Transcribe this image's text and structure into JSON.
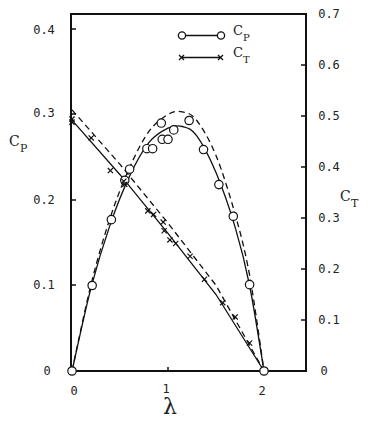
{
  "chart_data": {
    "type": "line",
    "title": "",
    "xlabel": "λ",
    "ylabel_left": "C_P",
    "ylabel_right": "C_T",
    "xlim": [
      0,
      2.45
    ],
    "ylim_left": [
      0,
      0.42
    ],
    "ylim_right": [
      0,
      0.7
    ],
    "grid": false,
    "legend_position": "upper center (inside plot)",
    "x_ticks": [
      0,
      1,
      2
    ],
    "x_tick_labels": [
      "0",
      "1",
      "2"
    ],
    "y_left_ticks": [
      0,
      0.1,
      0.2,
      0.3,
      0.4
    ],
    "y_left_tick_labels": [
      "0",
      "0.1",
      "0.2",
      "0.3",
      "0.4"
    ],
    "y_right_ticks": [
      0,
      0.1,
      0.2,
      0.3,
      0.4,
      0.5,
      0.6,
      0.7
    ],
    "y_right_tick_labels": [
      "0",
      "0.1",
      "0.2",
      "0.3",
      "0.4",
      "0.5",
      "0.6",
      "0.7"
    ],
    "legend": [
      {
        "label": "C_P",
        "marker": "circle",
        "line": "solid"
      },
      {
        "label": "C_T",
        "marker": "x",
        "line": "solid"
      }
    ],
    "series": [
      {
        "name": "C_P measured",
        "axis": "left",
        "marker": "circle",
        "points": [
          [
            0,
            0
          ],
          [
            0.21,
            0.1
          ],
          [
            0.41,
            0.177
          ],
          [
            0.55,
            0.223
          ],
          [
            0.6,
            0.236
          ],
          [
            0.78,
            0.26
          ],
          [
            0.84,
            0.26
          ],
          [
            0.93,
            0.29
          ],
          [
            0.94,
            0.271
          ],
          [
            1.0,
            0.271
          ],
          [
            1.06,
            0.282
          ],
          [
            1.22,
            0.293
          ],
          [
            1.37,
            0.259
          ],
          [
            1.53,
            0.218
          ],
          [
            1.68,
            0.181
          ],
          [
            1.85,
            0.101
          ],
          [
            2.0,
            0
          ]
        ]
      },
      {
        "name": "C_P solid curve",
        "axis": "left",
        "line": "solid",
        "points": [
          [
            0,
            0
          ],
          [
            0.2,
            0.098
          ],
          [
            0.4,
            0.172
          ],
          [
            0.6,
            0.228
          ],
          [
            0.8,
            0.267
          ],
          [
            1.0,
            0.284
          ],
          [
            1.15,
            0.286
          ],
          [
            1.3,
            0.275
          ],
          [
            1.5,
            0.232
          ],
          [
            1.7,
            0.168
          ],
          [
            1.85,
            0.1
          ],
          [
            2.0,
            0
          ]
        ]
      },
      {
        "name": "C_P dashed curve",
        "axis": "left",
        "line": "dashed",
        "points": [
          [
            0,
            0
          ],
          [
            0.2,
            0.102
          ],
          [
            0.4,
            0.18
          ],
          [
            0.6,
            0.238
          ],
          [
            0.8,
            0.28
          ],
          [
            1.0,
            0.3
          ],
          [
            1.15,
            0.303
          ],
          [
            1.3,
            0.293
          ],
          [
            1.5,
            0.252
          ],
          [
            1.7,
            0.183
          ],
          [
            1.85,
            0.112
          ],
          [
            2.0,
            0
          ]
        ]
      },
      {
        "name": "C_T measured",
        "axis": "right",
        "marker": "x",
        "points": [
          [
            0,
            0.494
          ],
          [
            0,
            0.488
          ],
          [
            0.2,
            0.457
          ],
          [
            0.4,
            0.393
          ],
          [
            0.54,
            0.372
          ],
          [
            0.55,
            0.366
          ],
          [
            0.79,
            0.314
          ],
          [
            0.85,
            0.307
          ],
          [
            0.95,
            0.292
          ],
          [
            0.96,
            0.275
          ],
          [
            1.02,
            0.257
          ],
          [
            1.08,
            0.25
          ],
          [
            1.23,
            0.225
          ],
          [
            1.38,
            0.18
          ],
          [
            1.57,
            0.134
          ],
          [
            1.7,
            0.106
          ],
          [
            1.85,
            0.055
          ]
        ]
      },
      {
        "name": "C_T solid curve",
        "axis": "right",
        "line": "solid",
        "points": [
          [
            0,
            0.492
          ],
          [
            0.5,
            0.385
          ],
          [
            1.0,
            0.27
          ],
          [
            1.5,
            0.15
          ],
          [
            2.0,
            0
          ]
        ]
      },
      {
        "name": "C_T dashed curve",
        "axis": "right",
        "line": "dashed",
        "points": [
          [
            0,
            0.512
          ],
          [
            0.5,
            0.405
          ],
          [
            1.0,
            0.29
          ],
          [
            1.5,
            0.168
          ],
          [
            2.0,
            0
          ]
        ]
      }
    ]
  },
  "labels": {
    "x_axis": "λ",
    "left_axis_main": "C",
    "left_axis_sub": "P",
    "right_axis_main": "C",
    "right_axis_sub": "T",
    "legend_cp_main": "C",
    "legend_cp_sub": "P",
    "legend_ct_main": "C",
    "legend_ct_sub": "T",
    "x_ticks": [
      "0",
      "1",
      "2"
    ],
    "left_ticks": [
      "0",
      "0.1",
      "0.2",
      "0.3",
      "0.4"
    ],
    "right_ticks": [
      "0",
      "0.1",
      "0.2",
      "0.3",
      "0.4",
      "0.5",
      "0.6",
      "0.7"
    ]
  },
  "style": {
    "line_color": "#111111",
    "background": "#ffffff"
  }
}
